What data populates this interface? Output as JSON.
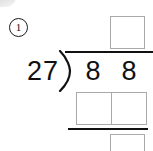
{
  "worksheet": {
    "problem_number": "1",
    "type": "long-division",
    "divisor": "27",
    "dividend_digits": [
      "8",
      "8"
    ],
    "dividend": "88",
    "boxes": {
      "quotient": "",
      "partial_product_left": "",
      "partial_product_right": "",
      "remainder": ""
    },
    "colors": {
      "ink": "#111111",
      "box_border": "#a9a9a9",
      "paper": "#ffffff"
    }
  }
}
